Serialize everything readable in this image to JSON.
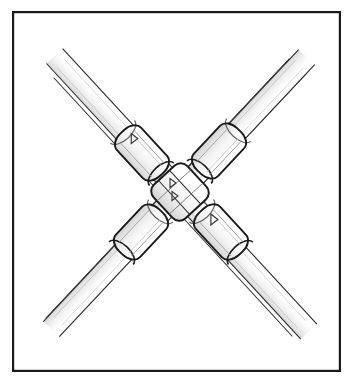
{
  "figure": {
    "title": "Crossed rod cross-clamp assembly",
    "domain": "Diagram",
    "drawing_style": "black-and-white technical line art",
    "background_color": "#ffffff",
    "line_color": "#1a1a1a",
    "fill_color": "#ffffff",
    "shading_color": "#b9b9b9",
    "border": {
      "label": "figure-frame",
      "x": 12,
      "y": 11,
      "width": 329,
      "height": 361,
      "stroke_width": 2.2,
      "color": "#1a1a1a"
    },
    "canvas": {
      "width": 353,
      "height": 386
    },
    "center": {
      "x": 180,
      "y": 192
    },
    "rods": [
      {
        "name": "rod-nw-se",
        "label": "Rod running from upper-left to lower-right",
        "angle_deg": 43,
        "start": {
          "x": 62,
          "y": 73
        },
        "end": {
          "x": 300,
          "y": 330
        },
        "width_px": 22,
        "depth": "back"
      },
      {
        "name": "rod-ne-sw",
        "label": "Rod running from upper-right to lower-left",
        "angle_deg": 137,
        "start": {
          "x": 298,
          "y": 65
        },
        "end": {
          "x": 60,
          "y": 325
        },
        "width_px": 22,
        "depth": "front"
      }
    ],
    "sleeves": [
      {
        "name": "sleeve-upper-left",
        "label": "Upper-left ferrule sleeve",
        "position": {
          "x": 140,
          "y": 152
        },
        "angle_deg": 43,
        "length_px": 58,
        "diameter_px": 33,
        "marker": "arrowhead"
      },
      {
        "name": "sleeve-upper-right",
        "label": "Upper-right ferrule sleeve",
        "position": {
          "x": 222,
          "y": 152
        },
        "angle_deg": 137,
        "length_px": 58,
        "diameter_px": 33,
        "marker": "none"
      },
      {
        "name": "sleeve-lower-left",
        "label": "Lower-left ferrule sleeve",
        "position": {
          "x": 140,
          "y": 230
        },
        "angle_deg": 137,
        "length_px": 58,
        "diameter_px": 33,
        "marker": "none"
      },
      {
        "name": "sleeve-lower-right",
        "label": "Lower-right ferrule sleeve",
        "position": {
          "x": 222,
          "y": 230
        },
        "angle_deg": 43,
        "length_px": 58,
        "diameter_px": 33,
        "marker": "arrowhead"
      }
    ],
    "center_clamp": {
      "name": "center-cross-clamp",
      "label": "Central cross clamp body joining both rods",
      "x": 180,
      "y": 192,
      "size_px": 46,
      "markers": [
        "small-arrowhead-upper",
        "small-arrowhead-lower"
      ]
    },
    "annotations": []
  }
}
